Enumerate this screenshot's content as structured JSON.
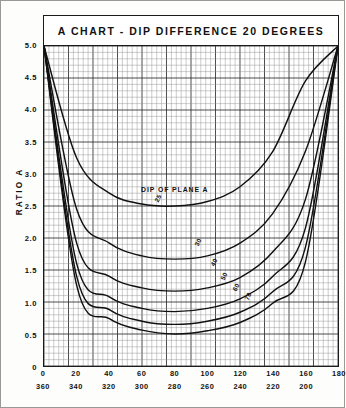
{
  "title": "A CHART - DIP DIFFERENCE 20 DEGREES",
  "axes": {
    "y_title": "RATIO A",
    "y_ticks": [
      "0",
      "0.5",
      "1.0",
      "1.5",
      "2.0",
      "2.5",
      "3.0",
      "3.5",
      "4.0",
      "4.5",
      "5.0"
    ],
    "x_ticks_top": [
      "0",
      "20",
      "40",
      "60",
      "80",
      "100",
      "120",
      "140",
      "160",
      "180"
    ],
    "x_ticks_bottom": [
      "360",
      "340",
      "320",
      "300",
      "280",
      "260",
      "240",
      "220",
      "200"
    ]
  },
  "annotations": {
    "plane_label": "DIP OF PLANE A"
  },
  "chart_data": {
    "type": "line",
    "title": "A CHART - DIP DIFFERENCE 20 DEGREES",
    "xlabel": "",
    "ylabel": "RATIO A",
    "xlim": [
      0,
      180
    ],
    "ylim": [
      0,
      5.0
    ],
    "grid": true,
    "legend": "inline-curve-labels",
    "x_axis_secondary": {
      "values": [
        360,
        340,
        320,
        300,
        280,
        260,
        240,
        220,
        200,
        180
      ],
      "note": "descending scale shown below primary axis"
    },
    "x": [
      0,
      20,
      40,
      60,
      80,
      100,
      120,
      140,
      160,
      180
    ],
    "series": [
      {
        "name": "25",
        "label": "25",
        "values": [
          5.0,
          3.25,
          2.7,
          2.53,
          2.5,
          2.57,
          2.8,
          3.35,
          4.45,
          5.0
        ],
        "minimum": {
          "x": 80,
          "y": 2.5
        }
      },
      {
        "name": "30",
        "label": "30",
        "values": [
          5.0,
          2.45,
          1.92,
          1.72,
          1.67,
          1.72,
          1.92,
          2.38,
          3.35,
          5.0
        ],
        "minimum": {
          "x": 80,
          "y": 1.66
        }
      },
      {
        "name": "40",
        "label": "40",
        "values": [
          5.0,
          1.92,
          1.4,
          1.22,
          1.17,
          1.22,
          1.38,
          1.78,
          2.6,
          5.0
        ],
        "minimum": {
          "x": 80,
          "y": 1.16
        }
      },
      {
        "name": "50",
        "label": "50",
        "values": [
          5.0,
          1.6,
          1.08,
          0.9,
          0.85,
          0.9,
          1.05,
          1.4,
          2.15,
          5.0
        ],
        "minimum": {
          "x": 80,
          "y": 0.84
        }
      },
      {
        "name": "60",
        "label": "60",
        "values": [
          5.0,
          1.4,
          0.88,
          0.7,
          0.65,
          0.7,
          0.84,
          1.16,
          1.85,
          5.0
        ],
        "minimum": {
          "x": 80,
          "y": 0.64
        }
      },
      {
        "name": "70",
        "label": "70",
        "values": [
          5.0,
          1.26,
          0.74,
          0.56,
          0.5,
          0.55,
          0.68,
          0.98,
          1.62,
          5.0
        ],
        "minimum": {
          "x": 80,
          "y": 0.5
        }
      }
    ]
  }
}
